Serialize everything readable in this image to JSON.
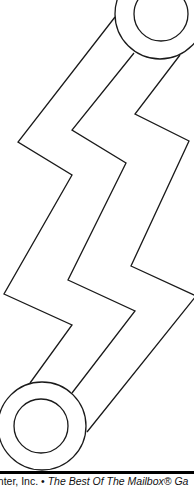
{
  "worksheet": {
    "activity": "maze",
    "start_marker": "circle-top-right",
    "end_marker": "circle-bottom-left",
    "line_color": "#1a1a1a",
    "background_color": "#ffffff"
  },
  "footer": {
    "publisher_text": "enter, Inc.",
    "separator": " • ",
    "title_text": "The Best Of The Mailbox® Ga"
  }
}
